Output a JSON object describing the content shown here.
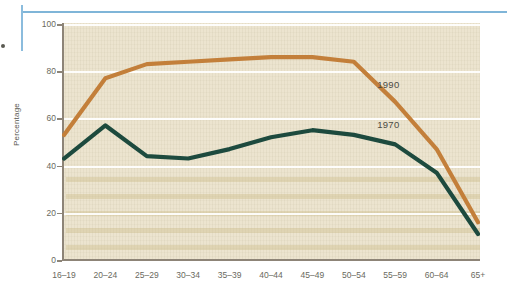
{
  "page": {
    "decorations": {
      "rule_color": "#7fb5d8"
    }
  },
  "chart_data": {
    "type": "line",
    "title": "",
    "subtitle": "",
    "xlabel": "",
    "ylabel": "Percentage",
    "ylim": [
      0,
      100
    ],
    "yticks": [
      0,
      20,
      40,
      60,
      80,
      100
    ],
    "ytick_labels": [
      "0",
      "20",
      "40",
      "60",
      "80",
      "100"
    ],
    "grid": "horizontal-white",
    "legend_position": "inline-annotations",
    "categories": [
      "16–19",
      "20–24",
      "25–29",
      "30–34",
      "35–39",
      "40–44",
      "45–49",
      "50–54",
      "55–59",
      "60–64",
      "65+"
    ],
    "series": [
      {
        "name": "1990",
        "color": "#c37f3a",
        "values": [
          53,
          77,
          83,
          84,
          85,
          86,
          86,
          84,
          67,
          47,
          16
        ]
      },
      {
        "name": "1970",
        "color": "#1d4a3e",
        "values": [
          43,
          57,
          44,
          43,
          47,
          52,
          55,
          53,
          49,
          37,
          11
        ]
      }
    ],
    "annotations": [
      {
        "text": "1990",
        "series": "1990",
        "x_category": "55–59",
        "value": 74
      },
      {
        "text": "1970",
        "series": "1970",
        "x_category": "55–59",
        "value": 57
      }
    ]
  }
}
